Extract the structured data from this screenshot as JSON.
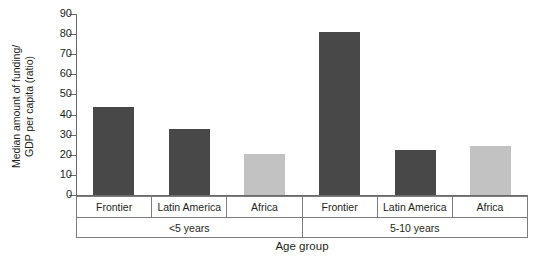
{
  "chart_data": {
    "type": "bar",
    "title": "",
    "subtitle": "",
    "xlabel": "Age group",
    "ylabel": "Median amount of funding/\nGDP per capita (ratio)",
    "ylim": [
      0,
      90
    ],
    "ytick_values": [
      0,
      10,
      20,
      30,
      40,
      50,
      60,
      70,
      80,
      90
    ],
    "ytick_labels": [
      "0",
      "10",
      "20",
      "30",
      "40",
      "50",
      "60",
      "70",
      "80",
      "90"
    ],
    "grid": false,
    "legend": "none",
    "group_labels": [
      "<5 years",
      "5-10 years"
    ],
    "categories": [
      "Frontier",
      "Latin America",
      "Africa",
      "Frontier",
      "Latin America",
      "Africa"
    ],
    "values": [
      44,
      33,
      20.5,
      81,
      22.5,
      24.5
    ],
    "bars": [
      {
        "group": "<5 years",
        "category": "Frontier",
        "value": 44,
        "color": "#484848"
      },
      {
        "group": "<5 years",
        "category": "Latin America",
        "value": 33,
        "color": "#484848"
      },
      {
        "group": "<5 years",
        "category": "Africa",
        "value": 20.5,
        "color": "#c2c2c2"
      },
      {
        "group": "5-10 years",
        "category": "Frontier",
        "value": 81,
        "color": "#484848"
      },
      {
        "group": "5-10 years",
        "category": "Latin America",
        "value": 22.5,
        "color": "#484848"
      },
      {
        "group": "5-10 years",
        "category": "Africa",
        "value": 24.5,
        "color": "#c2c2c2"
      }
    ],
    "colors": {
      "bar_dark": "#484848",
      "bar_light": "#c2c2c2",
      "axis": "#6a6a6a",
      "text": "#231f20",
      "background": "#ffffff"
    }
  }
}
